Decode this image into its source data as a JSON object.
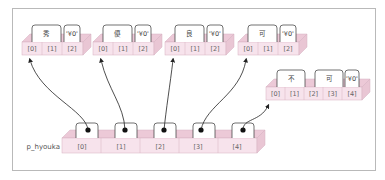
{
  "diagram": {
    "pointer_array": {
      "name": "p_hyouka",
      "indices": [
        "[0]",
        "[1]",
        "[2]",
        "[3]",
        "[4]"
      ]
    },
    "strings": [
      {
        "chars": [
          "秀",
          "'¥0'"
        ],
        "indices": [
          "[0]",
          "[1]",
          "[2]"
        ]
      },
      {
        "chars": [
          "優",
          "'¥0'"
        ],
        "indices": [
          "[0]",
          "[1]",
          "[2]"
        ]
      },
      {
        "chars": [
          "良",
          "'¥0'"
        ],
        "indices": [
          "[0]",
          "[1]",
          "[2]"
        ]
      },
      {
        "chars": [
          "可",
          "'¥0'"
        ],
        "indices": [
          "[0]",
          "[1]",
          "[2]"
        ]
      },
      {
        "chars": [
          "不",
          "可",
          "'¥0'"
        ],
        "indices": [
          "[0]",
          "[1]",
          "[2]",
          "[3]",
          "[4]"
        ]
      }
    ],
    "colors": {
      "cell_face": "#f7e3ec",
      "cell_top": "#ecc9d7",
      "cell_side": "#d9a9bd",
      "border": "#c9a3b3",
      "frame": "#b9b9b9"
    }
  }
}
